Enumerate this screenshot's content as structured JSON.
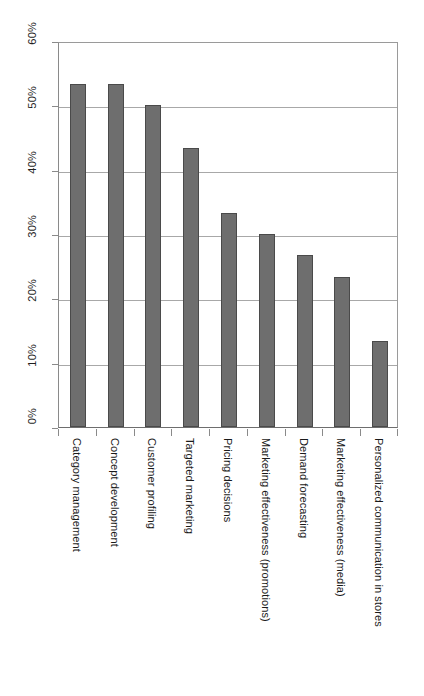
{
  "chart_data": {
    "type": "bar",
    "title": "",
    "subtitle": "",
    "xlabel": "",
    "ylabel": "",
    "ylim": [
      0,
      60
    ],
    "y_unit": "%",
    "grid": true,
    "legend": "none",
    "orientation": "vertical",
    "categories": [
      "Category management",
      "Concept development",
      "Customer profiling",
      "Targeted marketing",
      "Pricing decisions",
      "Marketing effectiveness (promotions)",
      "Demand forecasting",
      "Marketing effectiveness (media)",
      "Personalized communication in stores"
    ],
    "values": [
      53.3,
      53.3,
      50.0,
      43.3,
      33.3,
      30.0,
      26.7,
      23.3,
      13.3
    ],
    "y_ticks": [
      0,
      10,
      20,
      30,
      40,
      50,
      60
    ],
    "y_tick_labels": [
      "0%",
      "10%",
      "20%",
      "30%",
      "40%",
      "50%",
      "60%"
    ],
    "series": [
      {
        "name": "",
        "values": [
          53.3,
          53.3,
          50.0,
          43.3,
          33.3,
          30.0,
          26.7,
          23.3,
          13.3
        ],
        "color": "#6e6e6e",
        "border_color": "#4a4a4a"
      }
    ],
    "colors": {
      "bar_fill": "#6e6e6e",
      "bar_border": "#4a4a4a",
      "gridline": "#a8a8a8",
      "axis": "#8a8a8a",
      "background": "#ffffff",
      "text": "#1a1a1a"
    }
  }
}
